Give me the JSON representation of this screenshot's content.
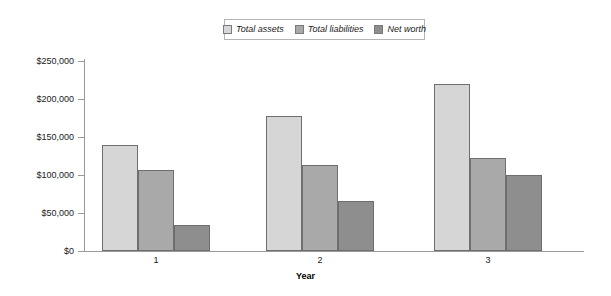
{
  "chart_data": {
    "type": "bar",
    "title": "",
    "xlabel": "Year",
    "ylabel": "",
    "categories": [
      "1",
      "2",
      "3"
    ],
    "series": [
      {
        "name": "Total assets",
        "color": "#d6d6d6",
        "values": [
          140000,
          178000,
          220000
        ]
      },
      {
        "name": "Total liabilities",
        "color": "#a9a9a9",
        "values": [
          107000,
          113000,
          122000
        ]
      },
      {
        "name": "Net worth",
        "color": "#8e8e8e",
        "values": [
          34000,
          66000,
          100000
        ]
      }
    ],
    "ylim": [
      0,
      250000
    ],
    "ytick_values": [
      0,
      50000,
      100000,
      150000,
      200000,
      250000
    ],
    "ytick_labels": [
      "$0",
      "$50,000",
      "$100,000",
      "$150,000",
      "$200,000",
      "$250,000"
    ],
    "grid": false,
    "legend_position": "top-center"
  },
  "legend": {
    "entries": [
      {
        "label": "Total assets",
        "swatch_name": "legend-swatch-total-assets"
      },
      {
        "label": "Total liabilities",
        "swatch_name": "legend-swatch-total-liabilities"
      },
      {
        "label": "Net worth",
        "swatch_name": "legend-swatch-net-worth"
      }
    ]
  }
}
